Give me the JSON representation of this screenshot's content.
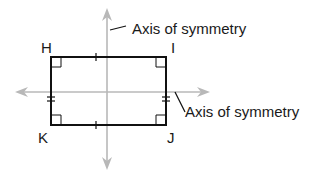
{
  "figure": {
    "type": "rectangle-symmetry",
    "vertices": [
      {
        "label": "H",
        "position": "top-left"
      },
      {
        "label": "I",
        "position": "top-right"
      },
      {
        "label": "J",
        "position": "bottom-right"
      },
      {
        "label": "K",
        "position": "bottom-left"
      }
    ],
    "axes": [
      {
        "id": "vertical",
        "label": "Axis of symmetry"
      },
      {
        "id": "horizontal",
        "label": "Axis of symmetry"
      }
    ],
    "markings": {
      "right_angles": 4,
      "single_tick_sides": [
        "HI",
        "KJ"
      ],
      "double_tick_sides": [
        "HK",
        "IJ"
      ]
    },
    "colors": {
      "shape": "#111111",
      "axis": "#b8b8b8",
      "text": "#1a1a1a"
    }
  }
}
